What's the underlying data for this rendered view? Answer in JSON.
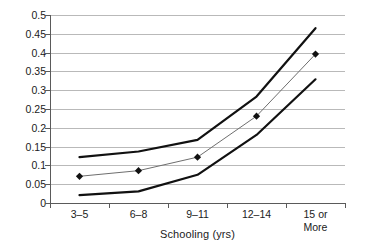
{
  "chart_data": {
    "type": "line",
    "title": "",
    "xlabel": "Schooling (yrs)",
    "ylabel": "",
    "categories": [
      "3–5",
      "6–8",
      "9–11",
      "12–14",
      "15 or\nMore"
    ],
    "ylim": [
      0,
      0.5
    ],
    "ytick_labels": [
      "0",
      "0.05",
      "0.1",
      "0.15",
      "0.2",
      "0.25",
      "0.3",
      "0.35",
      "0.4",
      "0.45",
      "0.5"
    ],
    "ytick_values": [
      0,
      0.05,
      0.1,
      0.15,
      0.2,
      0.25,
      0.3,
      0.35,
      0.4,
      0.45,
      0.5
    ],
    "grid": true,
    "legend": "none",
    "series": [
      {
        "name": "upper-bound",
        "values": [
          0.122,
          0.137,
          0.168,
          0.283,
          0.465
        ],
        "color": "#111111",
        "width": 2.2,
        "markers": false
      },
      {
        "name": "estimate",
        "values": [
          0.071,
          0.086,
          0.122,
          0.231,
          0.396
        ],
        "color": "#6e6e6e",
        "width": 1.0,
        "markers": true,
        "marker_shape": "diamond",
        "marker_color": "#111111"
      },
      {
        "name": "lower-bound",
        "values": [
          0.021,
          0.031,
          0.075,
          0.181,
          0.329
        ],
        "color": "#111111",
        "width": 2.2,
        "markers": false
      }
    ]
  }
}
